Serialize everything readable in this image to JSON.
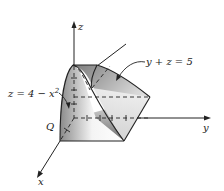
{
  "diagram": {
    "type": "3d-solid-region",
    "axes": {
      "x": {
        "label": "x"
      },
      "y": {
        "label": "y"
      },
      "z": {
        "label": "z"
      }
    },
    "surfaces": [
      {
        "name": "parabolic-cylinder",
        "equation": "z = 4 − x",
        "exponent": "2"
      },
      {
        "name": "plane",
        "equation": "y + z = 5"
      }
    ],
    "region_label": "Q",
    "colors": {
      "stroke": "#222222",
      "shade_dark": "#7a7a7a",
      "shade_light": "#f2f2f2"
    }
  }
}
